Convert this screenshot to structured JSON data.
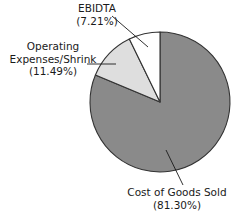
{
  "chart_data": {
    "type": "pie",
    "title": "",
    "subtitle": "",
    "xlabel": "",
    "ylabel": "",
    "legend_position": "none",
    "grid": false,
    "labels_position": "outside-with-leader-lines",
    "start_angle_deg": 0,
    "direction": "clockwise",
    "categories": [
      "Cost of Goods Sold",
      "Operating Expenses/Shrink",
      "EBIDTA"
    ],
    "values": [
      81.3,
      11.49,
      7.21
    ],
    "units": "percent",
    "colors": [
      "#8a8a8a",
      "#dedede",
      "#ffffff"
    ],
    "edge_color": "#333333",
    "slices": [
      {
        "name": "Cost of Goods Sold",
        "value": 81.3,
        "value_label": "(81.30%)",
        "color": "#8a8a8a",
        "start_deg": 0,
        "end_deg": 292.68
      },
      {
        "name": "Operating Expenses/Shrink",
        "value": 11.49,
        "value_label": "(11.49%)",
        "color": "#dedede",
        "start_deg": 292.68,
        "end_deg": 334.04
      },
      {
        "name": "EBIDTA",
        "value": 7.21,
        "value_label": "(7.21%)",
        "color": "#ffffff",
        "start_deg": 334.04,
        "end_deg": 360.0
      }
    ]
  },
  "labels": {
    "ebidta": {
      "name": "EBIDTA",
      "value": "(7.21%)"
    },
    "operating_expenses": {
      "name_line1": "Operating",
      "name_line2": "Expenses/Shrink",
      "value": "(11.49%)"
    },
    "cost_of_goods_sold": {
      "name": "Cost of Goods Sold",
      "value": "(81.30%)"
    }
  }
}
